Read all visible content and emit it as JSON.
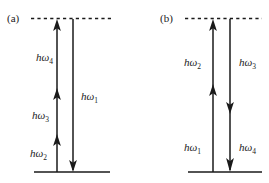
{
  "figure": {
    "background_color": "#ffffff",
    "ink_color": "#1a1a1a",
    "width": 269,
    "height": 183
  },
  "panels": [
    {
      "id": "a",
      "label": "(a)",
      "virtual_level_label": "",
      "ground_level_label": "",
      "transitions": [
        {
          "name": "h-omega-4",
          "symbol": "hω",
          "subscript": "4",
          "direction": "up",
          "label_x": 36,
          "label_y": 61
        },
        {
          "name": "h-omega-3",
          "symbol": "hω",
          "subscript": "3",
          "direction": "up",
          "label_x": 32,
          "label_y": 119
        },
        {
          "name": "h-omega-2",
          "symbol": "hω",
          "subscript": "2",
          "direction": "up",
          "label_x": 30,
          "label_y": 157
        },
        {
          "name": "h-omega-1",
          "symbol": "hω",
          "subscript": "1",
          "direction": "down",
          "label_x": 81,
          "label_y": 100
        }
      ]
    },
    {
      "id": "b",
      "label": "(b)",
      "virtual_level_label": "",
      "ground_level_label": "",
      "transitions": [
        {
          "name": "h-omega-2",
          "symbol": "hω",
          "subscript": "2",
          "direction": "up",
          "label_x": 184,
          "label_y": 66
        },
        {
          "name": "h-omega-3",
          "symbol": "hω",
          "subscript": "3",
          "direction": "down",
          "label_x": 239,
          "label_y": 66
        },
        {
          "name": "h-omega-1",
          "symbol": "hω",
          "subscript": "1",
          "direction": "up",
          "label_x": 184,
          "label_y": 151
        },
        {
          "name": "h-omega-4",
          "symbol": "hω",
          "subscript": "4",
          "direction": "down",
          "label_x": 239,
          "label_y": 151
        }
      ]
    }
  ]
}
